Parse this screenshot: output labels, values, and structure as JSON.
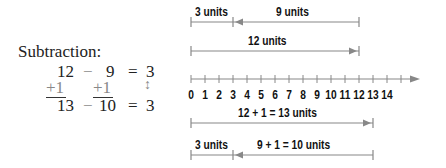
{
  "equation": {
    "title": "Subtraction:",
    "row1": {
      "a": "12",
      "op": "−",
      "b": "9",
      "eq": "=",
      "r": "3"
    },
    "row2": {
      "a": "+1",
      "b": "+1",
      "r": "↕"
    },
    "row3": {
      "a": "13",
      "op": "−",
      "b": "10",
      "eq": "=",
      "r": "3"
    }
  },
  "diagram": {
    "top_left_label": "3 units",
    "top_right_label": "9 units",
    "twelve_label": "12 units",
    "thirteen_label": "12  +  1  =  13 units",
    "bottom_left_label": "3 units",
    "bottom_right_label": "9  +  1  =  10  units",
    "line_color": "#888888"
  },
  "number_line": {
    "ticks": [
      "0",
      "1",
      "2",
      "3",
      "4",
      "5",
      "6",
      "7",
      "8",
      "9",
      "10",
      "11",
      "12",
      "13",
      "14"
    ]
  }
}
